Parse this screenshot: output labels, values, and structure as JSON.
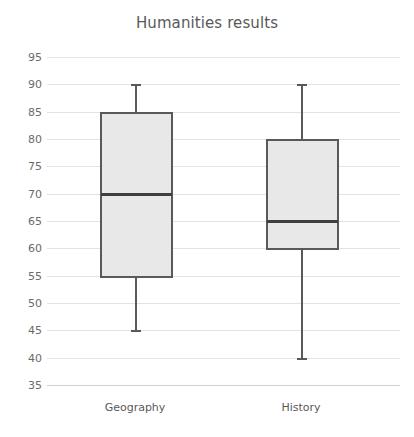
{
  "chart_data": {
    "type": "box",
    "title": "Humanities results",
    "xlabel": "",
    "ylabel": "",
    "categories": [
      "Geography",
      "History"
    ],
    "ylim": [
      35,
      95
    ],
    "ytick_step": 5,
    "yticks": [
      95,
      90,
      85,
      80,
      75,
      70,
      65,
      60,
      55,
      50,
      45,
      40,
      35
    ],
    "ytick_labels": [
      "95",
      "90",
      "85",
      "80",
      "75",
      "70",
      "65",
      "60",
      "55",
      "50",
      "45",
      "40",
      "35"
    ],
    "grid": true,
    "legend": "none",
    "series": [
      {
        "name": "Geography",
        "min": 45,
        "q1": 55,
        "median": 70,
        "q3": 85,
        "max": 90
      },
      {
        "name": "History",
        "min": 40,
        "q1": 60,
        "median": 65,
        "q3": 80,
        "max": 90
      }
    ],
    "colors": {
      "box_fill": "#e8e8e8",
      "box_stroke": "#595959",
      "median": "#3f3f3f",
      "whisker": "#595959",
      "grid": "#e3e3e3",
      "title_text": "#595959",
      "tick_text": "#6b6b6b",
      "background": "#ffffff"
    }
  }
}
